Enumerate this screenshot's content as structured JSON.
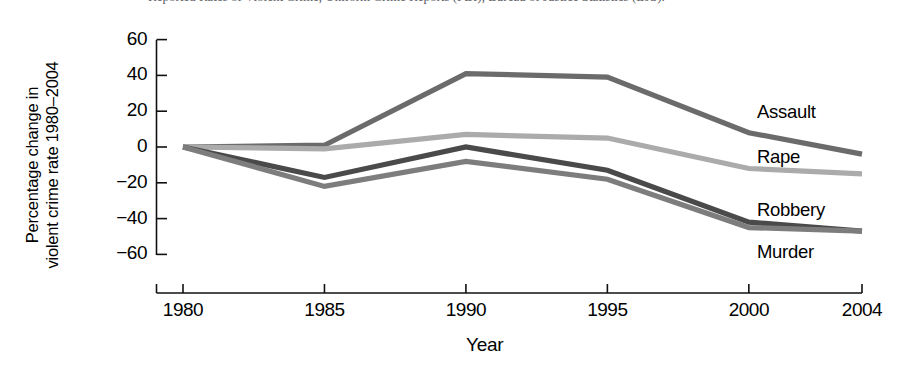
{
  "figure": {
    "caption_sliver": "Reported Rates of Violent Crime, Uniform Crime Reports (FBI), Bureau of Justice Statistics (BJS)."
  },
  "chart_data": {
    "type": "line",
    "title": "",
    "xlabel": "Year",
    "ylabel_line1": "Percentage change in",
    "ylabel_line2": "violent crime rate 1980–2004",
    "categories": [
      "1980",
      "1985",
      "1990",
      "1995",
      "2000",
      "2004"
    ],
    "x": [
      1980,
      1985,
      1990,
      1995,
      2000,
      2004
    ],
    "xlim": [
      1980,
      2004
    ],
    "ylim": [
      -60,
      60
    ],
    "yticks": [
      "60",
      "40",
      "20",
      "0",
      "−20",
      "−40",
      "−60"
    ],
    "ytick_values": [
      60,
      40,
      20,
      0,
      -20,
      -40,
      -60
    ],
    "grid": false,
    "legend_position": "right-inline-labels",
    "series": [
      {
        "name": "Assault",
        "color": "#6b6b6b",
        "values": [
          0,
          1,
          41,
          39,
          8,
          -4
        ]
      },
      {
        "name": "Rape",
        "color": "#ababab",
        "values": [
          0,
          -1,
          7,
          5,
          -12,
          -15
        ]
      },
      {
        "name": "Robbery",
        "color": "#4a4a4a",
        "values": [
          0,
          -17,
          0,
          -13,
          -42,
          -47
        ]
      },
      {
        "name": "Murder",
        "color": "#7d7d7d",
        "values": [
          0,
          -22,
          -8,
          -18,
          -45,
          -47
        ]
      }
    ]
  }
}
